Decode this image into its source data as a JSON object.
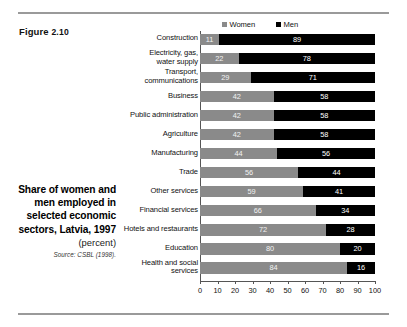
{
  "figure": {
    "prefix": "Figure",
    "number": "2.10"
  },
  "caption": {
    "title": "Share of women and men employed in selected economic sectors, Latvia, 1997",
    "unit": "(percent)",
    "source": "Source: CSBL (1998)."
  },
  "legend": {
    "position": "top",
    "items": [
      {
        "label": "Women",
        "color": "#8a8a8a",
        "swatch": "women-swatch"
      },
      {
        "label": "Men",
        "color": "#000000",
        "swatch": "men-swatch"
      }
    ]
  },
  "colors": {
    "women": "#8a8a8a",
    "men": "#000000",
    "rule": "#9a9a9a",
    "axis": "#555555",
    "background": "#ffffff"
  },
  "chart_data": {
    "type": "bar",
    "orientation": "horizontal",
    "stacked": true,
    "stacked_total": 100,
    "title": "Share of women and men employed in selected economic sectors, Latvia, 1997",
    "subtitle": "(percent)",
    "xlabel": "",
    "ylabel": "",
    "xlim": [
      0,
      100
    ],
    "grid": false,
    "legend": [
      "Women",
      "Men"
    ],
    "categories": [
      "Construction",
      "Electricity, gas, water supply",
      "Transport, communications",
      "Business",
      "Public administration",
      "Agriculture",
      "Manufacturing",
      "Trade",
      "Other services",
      "Financial services",
      "Hotels and restaurants",
      "Education",
      "Health and social services"
    ],
    "category_lines": [
      [
        "Construction"
      ],
      [
        "Electricity, gas,",
        "water supply"
      ],
      [
        "Transport,",
        "communications"
      ],
      [
        "Business"
      ],
      [
        "Public administration"
      ],
      [
        "Agriculture"
      ],
      [
        "Manufacturing"
      ],
      [
        "Trade"
      ],
      [
        "Other services"
      ],
      [
        "Financial services"
      ],
      [
        "Hotels and restaurants"
      ],
      [
        "Education"
      ],
      [
        "Health and social",
        "services"
      ]
    ],
    "series": [
      {
        "name": "Women",
        "color": "#8a8a8a",
        "values": [
          11,
          22,
          29,
          42,
          42,
          42,
          44,
          56,
          59,
          66,
          72,
          80,
          84
        ]
      },
      {
        "name": "Men",
        "color": "#000000",
        "values": [
          89,
          78,
          71,
          58,
          58,
          58,
          56,
          44,
          41,
          34,
          28,
          20,
          16
        ]
      }
    ],
    "xticks": [
      0,
      10,
      20,
      30,
      40,
      50,
      60,
      70,
      80,
      90,
      100
    ],
    "xticklabels": [
      "0",
      "10",
      "20",
      "30",
      "40",
      "50",
      "60",
      "70",
      "80",
      "90",
      "100"
    ]
  }
}
